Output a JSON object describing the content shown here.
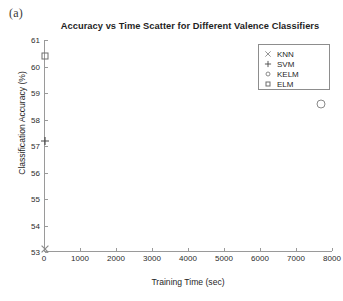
{
  "panel": {
    "letter": "(a)"
  },
  "chart_data": {
    "type": "scatter",
    "title": "Accuracy vs Time Scatter for Different Valence Classifiers",
    "xlabel": "Training Time (sec)",
    "ylabel": "Classification Accuracy (%)",
    "xlim": [
      0,
      8000
    ],
    "ylim": [
      53,
      61
    ],
    "xticks": [
      0,
      1000,
      2000,
      3000,
      4000,
      5000,
      6000,
      7000,
      8000
    ],
    "xtick_labels": [
      "0",
      "1000",
      "2000",
      "3000",
      "4000",
      "5000",
      "6000",
      "7000",
      "8000"
    ],
    "yticks": [
      53,
      54,
      55,
      56,
      57,
      58,
      59,
      60,
      61
    ],
    "ytick_labels": [
      "53",
      "54",
      "55",
      "56",
      "57",
      "58",
      "59",
      "60",
      "61"
    ],
    "grid": false,
    "legend_position": "upper right",
    "series": [
      {
        "name": "KNN",
        "marker": "x-cross-icon",
        "color": "#8a8a8a",
        "x": [
          20
        ],
        "y": [
          53.1
        ]
      },
      {
        "name": "SVM",
        "marker": "plus-icon",
        "color": "#4a4a4a",
        "x": [
          15
        ],
        "y": [
          57.2
        ]
      },
      {
        "name": "KELM",
        "marker": "circle-icon",
        "color": "#8a8a8a",
        "x": [
          7700
        ],
        "y": [
          58.6
        ]
      },
      {
        "name": "ELM",
        "marker": "square-icon",
        "color": "#6e6e6e",
        "x": [
          40
        ],
        "y": [
          60.4
        ]
      }
    ]
  }
}
